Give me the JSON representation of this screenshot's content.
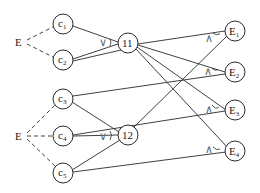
{
  "diagram": {
    "sources": [
      {
        "id": "E_top",
        "label": "E"
      },
      {
        "id": "E_bottom",
        "label": "E"
      }
    ],
    "conditions": [
      {
        "id": "c1",
        "label": "c",
        "sub": "1"
      },
      {
        "id": "c2",
        "label": "c",
        "sub": "2"
      },
      {
        "id": "c3",
        "label": "c",
        "sub": "3"
      },
      {
        "id": "c4",
        "label": "c",
        "sub": "4"
      },
      {
        "id": "c5",
        "label": "c",
        "sub": "5"
      }
    ],
    "gates": [
      {
        "id": "g11",
        "label": "11",
        "operator": "∨"
      },
      {
        "id": "g12",
        "label": "12",
        "operator": "∨"
      }
    ],
    "effects": [
      {
        "id": "E1",
        "label": "E",
        "sub": "1",
        "operator": "∧"
      },
      {
        "id": "E2",
        "label": "E",
        "sub": "2",
        "operator": "∧"
      },
      {
        "id": "E3",
        "label": "E",
        "sub": "3",
        "operator": "∧"
      },
      {
        "id": "E4",
        "label": "E",
        "sub": "4",
        "operator": "∧"
      }
    ],
    "dashed_edges": [
      [
        "E_top",
        "c1"
      ],
      [
        "E_top",
        "c2"
      ],
      [
        "E_bottom",
        "c3"
      ],
      [
        "E_bottom",
        "c4"
      ],
      [
        "E_bottom",
        "c5"
      ]
    ],
    "edges": [
      [
        "c1",
        "g11"
      ],
      [
        "c2",
        "g11"
      ],
      [
        "c2",
        "E1"
      ],
      [
        "g11",
        "E2"
      ],
      [
        "g11",
        "E3"
      ],
      [
        "g11",
        "E4"
      ],
      [
        "c3",
        "g12"
      ],
      [
        "c3",
        "E2"
      ],
      [
        "c4",
        "g12"
      ],
      [
        "c4",
        "E3"
      ],
      [
        "c5",
        "g12"
      ],
      [
        "c5",
        "E4"
      ],
      [
        "g12",
        "E1"
      ]
    ]
  }
}
